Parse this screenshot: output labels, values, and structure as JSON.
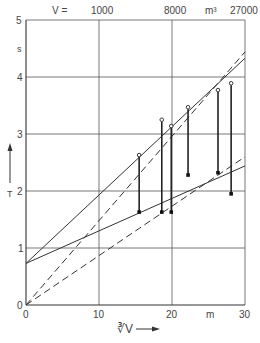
{
  "chart_data": {
    "type": "scatter",
    "title": "",
    "xlabel": "∛V",
    "ylabel": "T",
    "y_unit": "s",
    "x_unit": "m",
    "xlim": [
      0,
      30
    ],
    "ylim": [
      0,
      5
    ],
    "grid": true,
    "x_ticks": [
      "0",
      "10",
      "20",
      "30"
    ],
    "y_ticks": [
      "0",
      "1",
      "2",
      "3",
      "4",
      "5"
    ],
    "top_axis": {
      "prefix": "V =",
      "ticks": [
        {
          "x": 10,
          "label": "1000"
        },
        {
          "x": 20,
          "label": "8000"
        },
        {
          "x": 30,
          "label": "27000"
        }
      ],
      "unit": "m³"
    },
    "series": [
      {
        "name": "measured-upper (open circles)",
        "marker": "open-circle",
        "points": [
          [
            15.5,
            2.63
          ],
          [
            18.6,
            3.25
          ],
          [
            19.9,
            3.14
          ],
          [
            22.2,
            3.47
          ],
          [
            26.3,
            3.77
          ],
          [
            28.1,
            3.89
          ]
        ]
      },
      {
        "name": "measured-lower (filled squares)",
        "marker": "filled-square",
        "points": [
          [
            15.5,
            1.63
          ],
          [
            18.6,
            1.63
          ],
          [
            19.9,
            1.63
          ],
          [
            22.2,
            2.28
          ],
          [
            26.3,
            2.32
          ],
          [
            28.1,
            1.95
          ]
        ]
      }
    ],
    "lines": [
      {
        "name": "solid-steep",
        "style": "solid",
        "from": [
          0,
          0.73
        ],
        "to": [
          30,
          4.33
        ]
      },
      {
        "name": "solid-shallow",
        "style": "solid",
        "from": [
          0,
          0.73
        ],
        "to": [
          30,
          2.44
        ]
      },
      {
        "name": "dashed-steep",
        "style": "dashed",
        "from": [
          0,
          0
        ],
        "to": [
          30,
          4.44
        ]
      },
      {
        "name": "dashed-shallow",
        "style": "dashed",
        "from": [
          0,
          0
        ],
        "to": [
          30,
          2.6
        ]
      }
    ]
  },
  "labels": {
    "top_prefix": "V =",
    "top_1000": "1000",
    "top_8000": "8000",
    "top_unit": "m³",
    "top_27000": "27000",
    "y_unit": "s",
    "y_axis_name": "T",
    "x_axis_name": "∛V",
    "x_unit": "m",
    "x0": "0",
    "x10": "10",
    "x20": "20",
    "x30": "30",
    "y0": "0",
    "y1": "1",
    "y2": "2",
    "y3": "3",
    "y4": "4",
    "y5": "5"
  }
}
